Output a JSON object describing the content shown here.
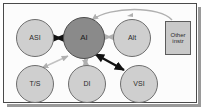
{
  "figure": {
    "background_color": "#fcfcfc",
    "frame_color": "#4a4a4a",
    "shadow_color": "#9a9a9a"
  },
  "nodes": {
    "asi": {
      "label": "ASI",
      "shape": "circle",
      "fill": "#cfcfcf",
      "x": 16,
      "y": 19
    },
    "ai": {
      "label": "AI",
      "shape": "circle",
      "fill": "#8a8a8a",
      "x": 63,
      "y": 17
    },
    "alt": {
      "label": "Alt",
      "shape": "circle",
      "fill": "#cfcfcf",
      "x": 113,
      "y": 19
    },
    "other": {
      "label_line1": "Other",
      "label_line2": "instr",
      "shape": "box",
      "fill": "#c9c9c9",
      "x": 165,
      "y": 21
    },
    "ts": {
      "label": "T/S",
      "shape": "circle",
      "fill": "#cfcfcf",
      "x": 16,
      "y": 65
    },
    "di": {
      "label": "DI",
      "shape": "circle",
      "fill": "#cfcfcf",
      "x": 68,
      "y": 65
    },
    "vsi": {
      "label": "VSI",
      "shape": "circle",
      "fill": "#cfcfcf",
      "x": 120,
      "y": 65
    }
  },
  "edges": [
    {
      "name": "asi-ai",
      "from": "ASI",
      "to": "AI",
      "style": "double-arrow",
      "color": "#121212",
      "weight": "bold"
    },
    {
      "name": "ai-alt",
      "from": "AI",
      "to": "Alt",
      "style": "double-arrow",
      "color": "#b5b5b5",
      "weight": "light"
    },
    {
      "name": "ai-ts",
      "from": "AI",
      "to": "T/S",
      "style": "double-arrow",
      "color": "#c2c2c2",
      "weight": "light"
    },
    {
      "name": "ai-di",
      "from": "AI",
      "to": "DI",
      "style": "double-arrow",
      "color": "#bcbcbc",
      "weight": "light"
    },
    {
      "name": "ai-vsi",
      "from": "AI",
      "to": "VSI",
      "style": "double-arrow",
      "color": "#121212",
      "weight": "bold"
    },
    {
      "name": "other-ai",
      "from": "Other instr",
      "to": "AI",
      "style": "curved-arrow",
      "color": "#b0b0b0",
      "weight": "light"
    }
  ],
  "colors": {
    "hub_fill": "#8a8a8a",
    "node_fill": "#cfcfcf",
    "box_fill": "#c9c9c9",
    "dark_arrow": "#121212",
    "light_arrow": "#b8b8b8",
    "node_stroke": "#6e6e6e"
  }
}
